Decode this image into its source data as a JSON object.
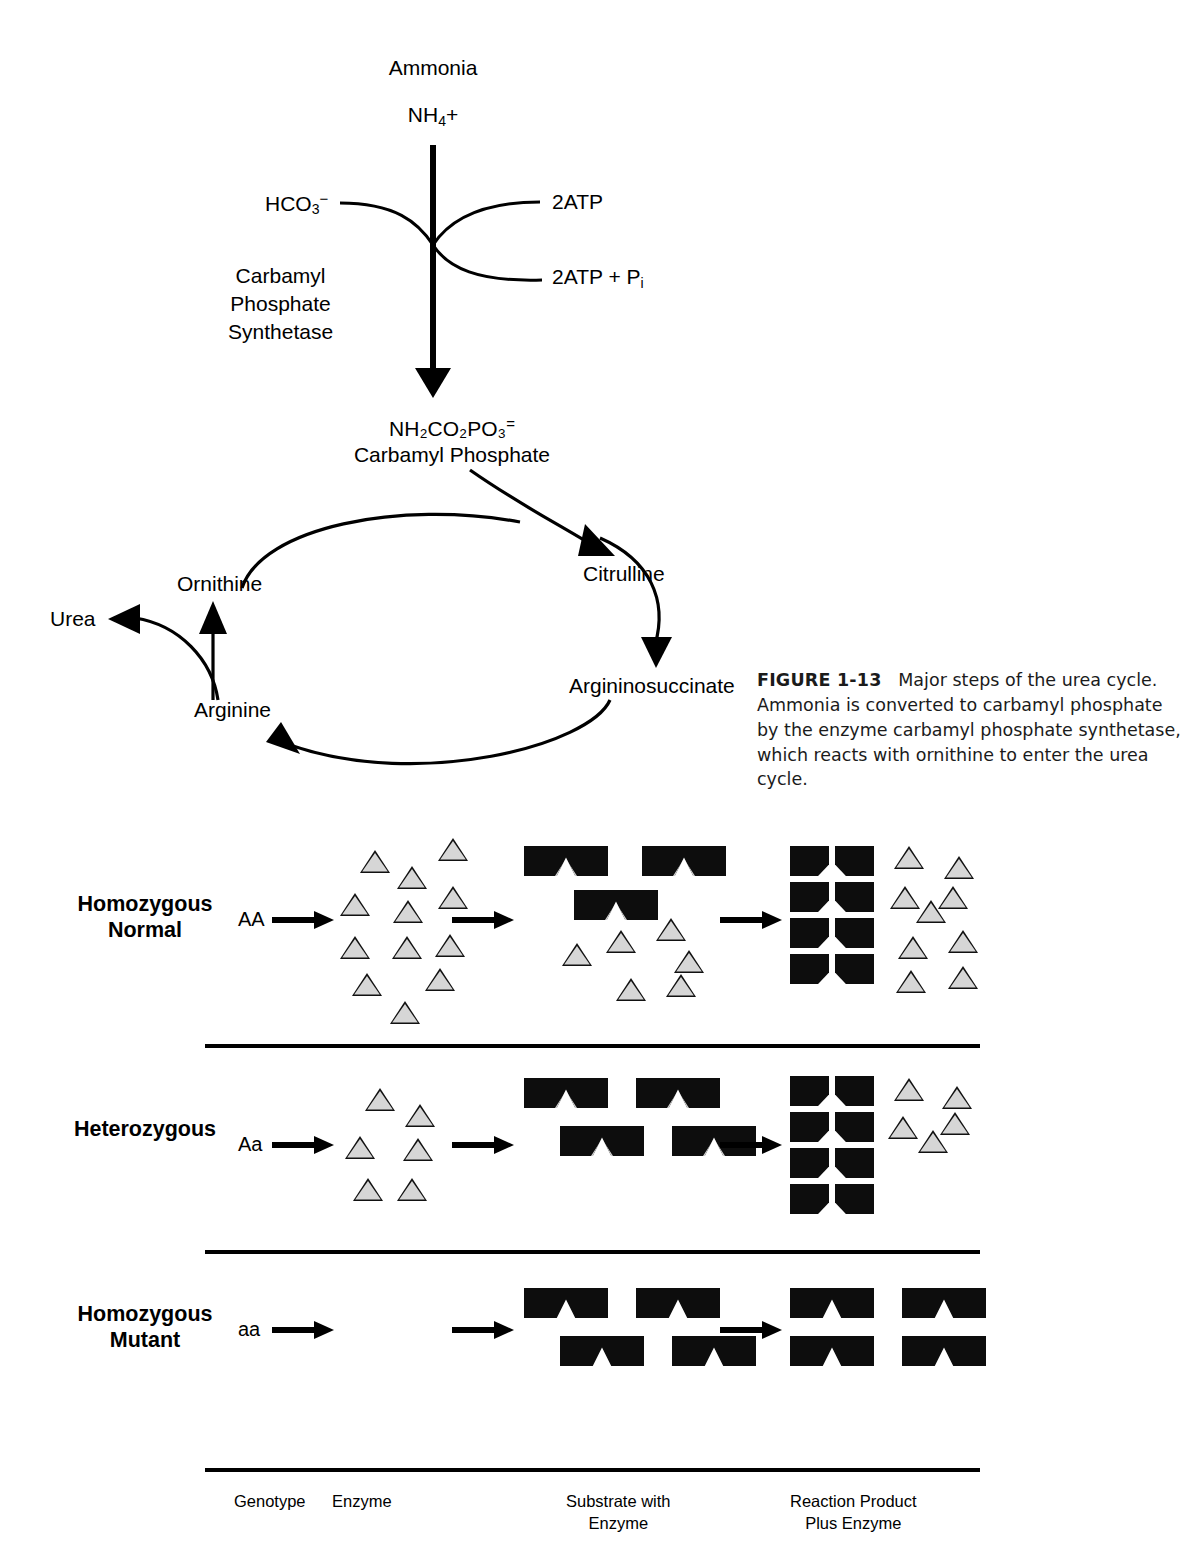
{
  "pathway": {
    "ammonia_label": "Ammonia",
    "ammonia_formula_main": "NH",
    "ammonia_formula_sub": "4",
    "ammonia_formula_tail": "+",
    "bicarbonate_main": "HCO",
    "bicarbonate_sub": "3",
    "bicarbonate_sup": "−",
    "enzyme_name": "Carbamyl\nPhosphate\nSynthetase",
    "atp_in": "2ATP",
    "atp_out_main": "2ATP + P",
    "atp_out_sub": "i",
    "product_formula": "NH₂CO₂PO₃",
    "product_charge": "=",
    "product_name": "Carbamyl Phosphate"
  },
  "cycle": {
    "urea": "Urea",
    "ornithine": "Ornithine",
    "citrulline": "Citrulline",
    "argininosuccinate": "Argininosuccinate",
    "arginine": "Arginine"
  },
  "caption": {
    "figure_number": "FIGURE 1-13",
    "text": "Major steps of the urea cycle. Ammonia is converted to carbamyl phosphate by the enzyme carbamyl phosphate synthetase, which reacts with ornithine to enter the urea cycle."
  },
  "panel": {
    "columns": [
      {
        "label": "Genotype"
      },
      {
        "label": "Enzyme"
      },
      {
        "label": "Substrate with\nEnzyme"
      },
      {
        "label": "Reaction Product\nPlus Enzyme"
      }
    ],
    "rows": [
      {
        "name": "Homozygous\nNormal",
        "genotype": "AA",
        "enzyme_count": 12,
        "substrate_count": 3,
        "substrate_has_enzyme": true,
        "substrate_free_enzyme_count": 6,
        "product_pair_count": 4,
        "product_free_enzyme_count": 9,
        "product_intact_count": 0
      },
      {
        "name": "Heterozygous",
        "genotype": "Aa",
        "enzyme_count": 6,
        "substrate_count": 4,
        "substrate_has_enzyme": true,
        "substrate_free_enzyme_count": 0,
        "product_pair_count": 4,
        "product_free_enzyme_count": 5,
        "product_intact_count": 0
      },
      {
        "name": "Homozygous\nMutant",
        "genotype": "aa",
        "enzyme_count": 0,
        "substrate_count": 4,
        "substrate_has_enzyme": false,
        "substrate_free_enzyme_count": 0,
        "product_pair_count": 0,
        "product_free_enzyme_count": 0,
        "product_intact_count": 4
      }
    ]
  },
  "colors": {
    "ink": "#000000",
    "enzyme_fill": "#d6d6d6",
    "block_fill": "#0d0d0d"
  }
}
